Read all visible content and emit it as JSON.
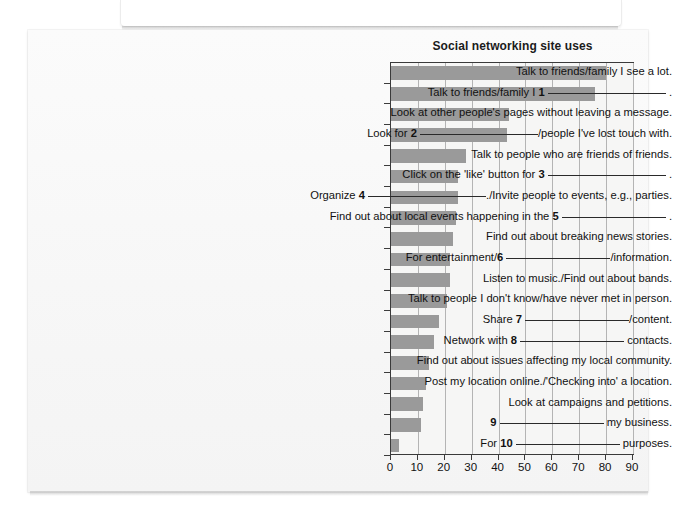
{
  "chart_data": {
    "type": "bar",
    "orientation": "horizontal",
    "title": "Social networking site uses",
    "xlabel": "",
    "ylabel": "",
    "xlim": [
      0,
      90
    ],
    "xticks": [
      0,
      10,
      20,
      30,
      40,
      50,
      60,
      70,
      80,
      90
    ],
    "grid": true,
    "legend": "none",
    "bar_color": "#9a9a9a",
    "categories": [
      "Talk to friends/family I see a lot.",
      "Talk to friends/family I 1 ____________ .",
      "Look at other people's pages without leaving a message.",
      "Look for 2 ____________/people I've lost touch with.",
      "Talk to people who are friends of friends.",
      "Click on the 'like' button for 3 ____________ .",
      "Organize 4 ____________./Invite people to events, e.g., parties.",
      "Find out about local events happening in the 5 ____________ .",
      "Find out about breaking news stories.",
      "For entertainment/6 ____________/information.",
      "Listen to music./Find out about bands.",
      "Talk to people I don't know/have never met in person.",
      "Share 7 ____________/content.",
      "Network with 8 ____________ contacts.",
      "Find out about issues affecting my local community.",
      "Post my location online./'Checking into' a location.",
      "Look at campaigns and petitions.",
      "9 ____________ my business.",
      "For 10 ____________ purposes."
    ],
    "values": [
      80,
      76,
      44,
      43,
      28,
      25,
      25,
      24,
      23,
      22,
      22,
      21,
      18,
      16,
      14,
      13,
      12,
      11,
      3
    ]
  },
  "labels": [
    {
      "pre": "Talk to friends/family I see a lot.",
      "num": "",
      "line": "",
      "post": ""
    },
    {
      "pre": "Talk to friends/family I ",
      "num": "1",
      "line": "lg",
      "post": " ."
    },
    {
      "pre": "Look at other people's pages without leaving a message.",
      "num": "",
      "line": "",
      "post": ""
    },
    {
      "pre": "Look for ",
      "num": "2",
      "line": "lg",
      "post": "/people I've lost touch with."
    },
    {
      "pre": "Talk to people who are friends of friends.",
      "num": "",
      "line": "",
      "post": ""
    },
    {
      "pre": "Click on the 'like' button for ",
      "num": "3",
      "line": "lg",
      "post": " ."
    },
    {
      "pre": "Organize ",
      "num": "4",
      "line": "lg",
      "post": "./Invite people to events, e.g., parties."
    },
    {
      "pre": "Find out about local events happening in the ",
      "num": "5",
      "line": "md",
      "post": " ."
    },
    {
      "pre": "Find out about breaking news stories.",
      "num": "",
      "line": "",
      "post": ""
    },
    {
      "pre": "For entertainment/",
      "num": "6",
      "line": "md",
      "post": "/information."
    },
    {
      "pre": "Listen to music./Find out about bands.",
      "num": "",
      "line": "",
      "post": ""
    },
    {
      "pre": "Talk to people I don't know/have never met in person.",
      "num": "",
      "line": "",
      "post": ""
    },
    {
      "pre": "Share ",
      "num": "7",
      "line": "md",
      "post": "/content."
    },
    {
      "pre": "Network with ",
      "num": "8",
      "line": "md",
      "post": " contacts."
    },
    {
      "pre": "Find out about issues affecting my local community.",
      "num": "",
      "line": "",
      "post": ""
    },
    {
      "pre": "Post my location online./'Checking into' a location.",
      "num": "",
      "line": "",
      "post": ""
    },
    {
      "pre": "Look at campaigns and petitions.",
      "num": "",
      "line": "",
      "post": ""
    },
    {
      "pre": "",
      "num": "9",
      "line": "md",
      "post": " my business."
    },
    {
      "pre": "For ",
      "num": "10",
      "line": "md",
      "post": " purposes."
    }
  ]
}
